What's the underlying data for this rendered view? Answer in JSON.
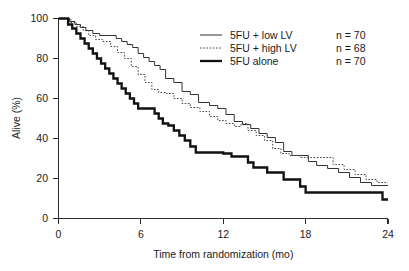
{
  "chart_data": {
    "type": "line",
    "subtype": "kaplan-meier-survival-step",
    "title": "",
    "xlabel": "Time from randomization (mo)",
    "ylabel": "Alive (%)",
    "xlim": [
      0,
      24
    ],
    "ylim": [
      0,
      100
    ],
    "xticks": [
      0,
      6,
      12,
      18,
      24
    ],
    "yticks": [
      0,
      20,
      40,
      60,
      80,
      100
    ],
    "xtick_labels": [
      "0",
      "6",
      "12",
      "18",
      "24"
    ],
    "ytick_labels": [
      "0",
      "20",
      "40",
      "60",
      "80",
      "100"
    ],
    "grid": false,
    "legend_position": "top-right",
    "series": [
      {
        "name": "5FU + low LV",
        "n_label": "n = 70",
        "n": 70,
        "style": "thin-solid",
        "color": "#333333",
        "points": [
          [
            0.0,
            100
          ],
          [
            0.5,
            100
          ],
          [
            0.8,
            98.5
          ],
          [
            1.2,
            97.0
          ],
          [
            1.6,
            95.5
          ],
          [
            2.0,
            94.0
          ],
          [
            2.5,
            92.5
          ],
          [
            3.0,
            91.5
          ],
          [
            3.6,
            91.5
          ],
          [
            4.2,
            90.0
          ],
          [
            4.6,
            88.5
          ],
          [
            5.0,
            87.0
          ],
          [
            5.4,
            85.5
          ],
          [
            5.8,
            82.5
          ],
          [
            6.2,
            80.5
          ],
          [
            6.6,
            78.5
          ],
          [
            7.0,
            76.5
          ],
          [
            7.4,
            74.5
          ],
          [
            7.8,
            70.0
          ],
          [
            8.4,
            68.0
          ],
          [
            9.0,
            63.5
          ],
          [
            9.6,
            62.0
          ],
          [
            10.2,
            58.0
          ],
          [
            11.0,
            56.5
          ],
          [
            11.6,
            55.0
          ],
          [
            12.2,
            52.0
          ],
          [
            12.8,
            48.5
          ],
          [
            13.4,
            47.0
          ],
          [
            14.0,
            45.0
          ],
          [
            14.6,
            42.5
          ],
          [
            15.2,
            40.5
          ],
          [
            15.8,
            38.0
          ],
          [
            16.4,
            33.5
          ],
          [
            17.0,
            31.5
          ],
          [
            17.6,
            31.5
          ],
          [
            18.2,
            28.5
          ],
          [
            18.8,
            26.5
          ],
          [
            19.6,
            25.0
          ],
          [
            20.4,
            23.0
          ],
          [
            21.2,
            20.5
          ],
          [
            22.0,
            18.0
          ],
          [
            22.8,
            16.5
          ],
          [
            24.0,
            16.5
          ]
        ]
      },
      {
        "name": "5FU + high LV",
        "n_label": "n = 68",
        "n": 68,
        "style": "dotted",
        "color": "#444444",
        "points": [
          [
            0.0,
            100
          ],
          [
            0.5,
            100
          ],
          [
            0.9,
            98.0
          ],
          [
            1.3,
            96.0
          ],
          [
            1.8,
            94.0
          ],
          [
            2.2,
            91.5
          ],
          [
            2.7,
            89.5
          ],
          [
            3.2,
            88.5
          ],
          [
            3.8,
            86.0
          ],
          [
            4.3,
            83.0
          ],
          [
            4.8,
            80.0
          ],
          [
            5.3,
            76.0
          ],
          [
            5.8,
            72.0
          ],
          [
            6.3,
            68.0
          ],
          [
            6.8,
            64.5
          ],
          [
            7.3,
            63.0
          ],
          [
            7.8,
            62.5
          ],
          [
            8.4,
            60.0
          ],
          [
            9.0,
            57.5
          ],
          [
            9.6,
            55.5
          ],
          [
            10.3,
            53.5
          ],
          [
            11.0,
            51.0
          ],
          [
            11.6,
            49.0
          ],
          [
            12.2,
            47.5
          ],
          [
            12.8,
            46.0
          ],
          [
            13.3,
            47.5
          ],
          [
            13.8,
            44.0
          ],
          [
            14.4,
            41.5
          ],
          [
            15.0,
            39.0
          ],
          [
            15.6,
            35.0
          ],
          [
            16.2,
            32.5
          ],
          [
            16.8,
            31.5
          ],
          [
            17.6,
            30.5
          ],
          [
            18.4,
            30.5
          ],
          [
            19.2,
            30.5
          ],
          [
            20.0,
            27.0
          ],
          [
            20.8,
            24.5
          ],
          [
            21.6,
            22.0
          ],
          [
            22.4,
            19.5
          ],
          [
            23.2,
            18.0
          ],
          [
            24.0,
            18.0
          ]
        ]
      },
      {
        "name": "5FU alone",
        "n_label": "n = 70",
        "n": 70,
        "style": "thick-solid",
        "color": "#111111",
        "points": [
          [
            0.0,
            100
          ],
          [
            0.4,
            100
          ],
          [
            0.7,
            97.0
          ],
          [
            1.0,
            95.0
          ],
          [
            1.3,
            92.5
          ],
          [
            1.6,
            90.0
          ],
          [
            1.9,
            87.5
          ],
          [
            2.2,
            85.0
          ],
          [
            2.5,
            82.5
          ],
          [
            2.8,
            80.0
          ],
          [
            3.1,
            77.5
          ],
          [
            3.4,
            75.0
          ],
          [
            3.7,
            72.5
          ],
          [
            4.0,
            70.0
          ],
          [
            4.3,
            67.5
          ],
          [
            4.6,
            65.0
          ],
          [
            4.9,
            62.5
          ],
          [
            5.2,
            60.0
          ],
          [
            5.5,
            57.5
          ],
          [
            5.8,
            55.0
          ],
          [
            6.6,
            55.0
          ],
          [
            7.0,
            52.5
          ],
          [
            7.3,
            50.0
          ],
          [
            7.6,
            47.5
          ],
          [
            8.0,
            46.5
          ],
          [
            8.4,
            44.0
          ],
          [
            8.8,
            41.5
          ],
          [
            9.2,
            39.0
          ],
          [
            9.6,
            36.0
          ],
          [
            10.0,
            33.0
          ],
          [
            11.0,
            33.0
          ],
          [
            12.0,
            32.5
          ],
          [
            12.6,
            31.0
          ],
          [
            13.4,
            31.0
          ],
          [
            13.8,
            28.0
          ],
          [
            14.2,
            25.5
          ],
          [
            14.8,
            25.5
          ],
          [
            15.2,
            23.0
          ],
          [
            16.0,
            23.0
          ],
          [
            16.4,
            19.5
          ],
          [
            17.0,
            19.5
          ],
          [
            17.6,
            16.0
          ],
          [
            18.0,
            13.0
          ],
          [
            22.0,
            13.0
          ],
          [
            23.5,
            13.0
          ],
          [
            23.6,
            9.5
          ],
          [
            24.0,
            9.5
          ]
        ]
      }
    ]
  },
  "legend": {
    "entries": [
      {
        "label": "5FU + low LV",
        "count": "n = 70",
        "icon": "thin-solid-line-icon"
      },
      {
        "label": "5FU + high LV",
        "count": "n = 68",
        "icon": "dotted-line-icon"
      },
      {
        "label": "5FU alone",
        "count": "n = 70",
        "icon": "thick-solid-line-icon"
      }
    ]
  },
  "axes": {
    "x_title": "Time from randomization (mo)",
    "y_title": "Alive (%)",
    "x_labels": [
      "0",
      "6",
      "12",
      "18",
      "24"
    ],
    "y_labels": [
      "0",
      "20",
      "40",
      "60",
      "80",
      "100"
    ]
  },
  "colors": {
    "background": "#ffffff",
    "axis": "#2b2b2b",
    "text": "#1a1a1a",
    "series_low_lv": "#333333",
    "series_high_lv": "#444444",
    "series_alone": "#111111"
  }
}
